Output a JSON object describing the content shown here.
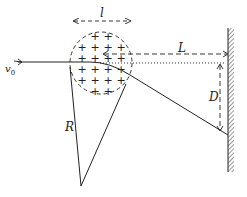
{
  "diagram": {
    "labels": {
      "width": "l",
      "velocity": "v",
      "velocity_sub": "0",
      "distance_to_screen": "L",
      "deflection": "D",
      "radius": "R"
    },
    "charge_symbol": "+",
    "charge_grid": [
      [
        0,
        1,
        1,
        0
      ],
      [
        1,
        1,
        1,
        1
      ],
      [
        1,
        1,
        1,
        1
      ],
      [
        1,
        1,
        1,
        1
      ],
      [
        1,
        1,
        1,
        1
      ],
      [
        0,
        1,
        1,
        0
      ]
    ],
    "colors": {
      "stroke": "#222222",
      "background": "#ffffff"
    }
  }
}
